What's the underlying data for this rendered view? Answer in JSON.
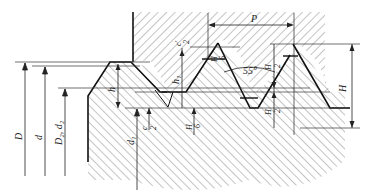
{
  "diagram": {
    "type": "thread-profile",
    "labels": {
      "D": "D",
      "d": "d",
      "D2d2": "D₂, d₂",
      "d1": "d₁",
      "P": "P",
      "H": "H",
      "h": "h",
      "h1": "h₁",
      "angle": "55°",
      "c": "c",
      "c2": "c",
      "two": "2",
      "H6a": "H",
      "six_a": "6",
      "H6b": "H",
      "six_b": "6",
      "H2a": "H",
      "two_a": "2",
      "H2b": "H",
      "two_b": "2",
      "cprime": "c′",
      "two_c": "2"
    }
  }
}
